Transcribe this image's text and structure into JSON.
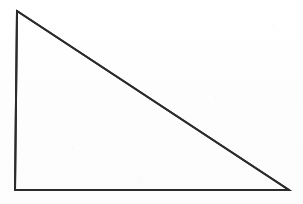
{
  "figure": {
    "name": "right-triangle",
    "type": "line-drawing",
    "title": "",
    "caption": "",
    "width": 303,
    "height": 204,
    "background_color": "#fefefe",
    "stroke_color": "#2b2b2b",
    "stroke_width": 2,
    "fill": "none",
    "shape": {
      "kind": "triangle",
      "classification": "right triangle",
      "right_angle_vertex": "bottom-left",
      "vertices": [
        {
          "label": "apex",
          "x": 17,
          "y": 11
        },
        {
          "label": "bottom-left",
          "x": 15,
          "y": 190
        },
        {
          "label": "bottom-right",
          "x": 289,
          "y": 190
        }
      ],
      "edges": [
        {
          "name": "vertical-leg",
          "from": "apex",
          "to": "bottom-left",
          "length_px": 179
        },
        {
          "name": "horizontal-leg",
          "from": "bottom-left",
          "to": "bottom-right",
          "length_px": 274
        },
        {
          "name": "hypotenuse",
          "from": "apex",
          "to": "bottom-right",
          "length_px": 327
        }
      ],
      "points_path": "17,11 15,190 289,190"
    },
    "labels": [],
    "annotations": []
  }
}
